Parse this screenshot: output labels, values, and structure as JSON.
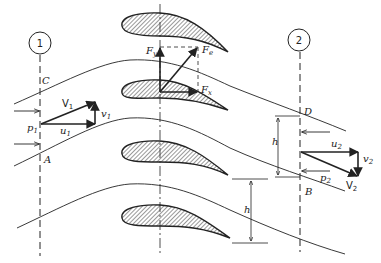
{
  "diagram": {
    "stations": [
      {
        "id": "station-1",
        "label": "1"
      },
      {
        "id": "station-2",
        "label": "2"
      }
    ],
    "points": {
      "A": "A",
      "B": "B",
      "C": "C",
      "D": "D"
    },
    "inlet": {
      "pressure": "p",
      "pressure_sub": "1",
      "velocity": "V",
      "velocity_sub": "1",
      "u": "u",
      "u_sub": "1",
      "v": "v",
      "v_sub": "1"
    },
    "outlet": {
      "pressure": "p",
      "pressure_sub": "2",
      "velocity": "V",
      "velocity_sub": "2",
      "u": "u",
      "u_sub": "2",
      "v": "v",
      "v_sub": "2"
    },
    "forces": {
      "Fy": "F",
      "Fy_sub": "y",
      "Fx": "F",
      "Fx_sub": "x",
      "Fe": "F",
      "Fe_sub": "e"
    },
    "spacing": {
      "h1": "h",
      "h2": "h"
    },
    "colors": {
      "line": "#222222",
      "background": "#ffffff"
    }
  }
}
